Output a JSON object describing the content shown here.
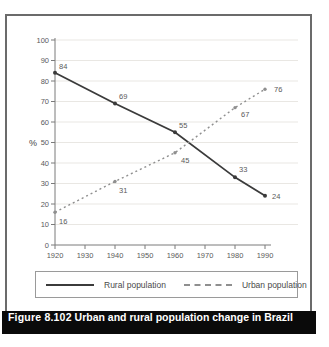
{
  "figure": {
    "caption_number": "Figure 8.102",
    "caption_text": "Urban and rural population change in Brazil"
  },
  "chart_data": {
    "type": "line",
    "title": "",
    "xlabel": "",
    "ylabel": "%",
    "xlim": [
      1920,
      1990
    ],
    "ylim": [
      0,
      100
    ],
    "grid": true,
    "legend_position": "bottom",
    "x_axis_ticks": [
      1920,
      1930,
      1940,
      1950,
      1960,
      1970,
      1980,
      1990
    ],
    "y_axis_ticks": [
      0,
      10,
      20,
      30,
      40,
      50,
      60,
      70,
      80,
      90,
      100
    ],
    "x": [
      1920,
      1940,
      1960,
      1980,
      1990
    ],
    "series": [
      {
        "name": "Rural population",
        "style": "solid",
        "color": "#3b3b3b",
        "values": [
          84,
          69,
          55,
          33,
          24
        ]
      },
      {
        "name": "Urban population",
        "style": "dashed",
        "color": "#8f8f8f",
        "values": [
          16,
          31,
          45,
          67,
          76
        ]
      }
    ]
  },
  "legend": {
    "items": [
      {
        "label": "Rural population",
        "style": "solid"
      },
      {
        "label": "Urban population",
        "style": "dashed"
      }
    ]
  },
  "colors": {
    "box_border": "#6b6b6b",
    "axis": "#7a7a7a",
    "grid": "#e9e7e3",
    "tick_text": "#5a5a5a",
    "caption_bg": "#0a0a0a",
    "caption_text": "#ffffff"
  }
}
